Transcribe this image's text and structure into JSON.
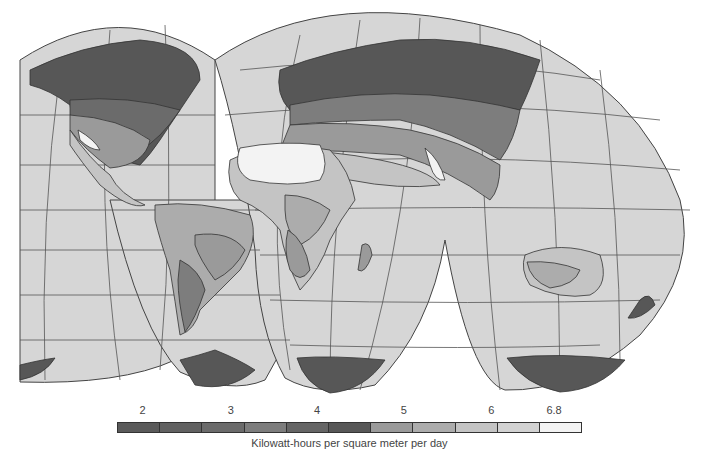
{
  "map": {
    "title": "World solar insolation map",
    "projection": "interrupted homolosine",
    "ocean_color": "#d6d6d6",
    "graticule_color": "#444444"
  },
  "legend": {
    "ticks": [
      {
        "label": "2",
        "pos": 0.055
      },
      {
        "label": "3",
        "pos": 0.245
      },
      {
        "label": "4",
        "pos": 0.43
      },
      {
        "label": "5",
        "pos": 0.617
      },
      {
        "label": "6",
        "pos": 0.805
      },
      {
        "label": "6.8",
        "pos": 0.94
      }
    ],
    "swatches": [
      "#5a5a5a",
      "#616161",
      "#6b6b6b",
      "#7d7d7d",
      "#656565",
      "#575757",
      "#9a9a9a",
      "#acacac",
      "#c4c4c4",
      "#d2d2d2",
      "#f3f3f3"
    ],
    "caption": "Kilowatt-hours per square meter per day"
  }
}
